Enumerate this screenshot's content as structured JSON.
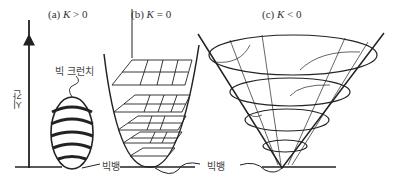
{
  "panels": [
    {
      "id": "a",
      "label_prefix": "(a)",
      "label_var": "K",
      "label_rel": "> 0",
      "description": "closed universe"
    },
    {
      "id": "b",
      "label_prefix": "(b)",
      "label_var": "K",
      "label_rel": "= 0",
      "description": "flat universe"
    },
    {
      "id": "c",
      "label_prefix": "(c)",
      "label_var": "K",
      "label_rel": "< 0",
      "description": "open universe"
    }
  ],
  "annotations": {
    "time_axis": "시간",
    "big_crunch": "빅 크런치",
    "big_bang_1": "빅뱅",
    "big_bang_2": "빅뱅"
  },
  "colors": {
    "ink": "#222222",
    "background": "#ffffff"
  }
}
